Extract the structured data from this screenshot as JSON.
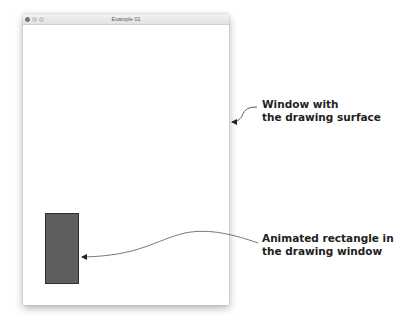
{
  "window": {
    "title": "Example 01",
    "controls": [
      "close",
      "minimize",
      "maximize"
    ],
    "surface_color": "#ffffff"
  },
  "canvas": {
    "rectangle": {
      "fill": "#5e5e5e",
      "stroke": "#2e2e2e"
    }
  },
  "annotations": {
    "window": {
      "line1": "Window with",
      "line2": "the drawing surface"
    },
    "rectangle": {
      "line1": "Animated rectangle in",
      "line2": "the drawing window"
    }
  }
}
